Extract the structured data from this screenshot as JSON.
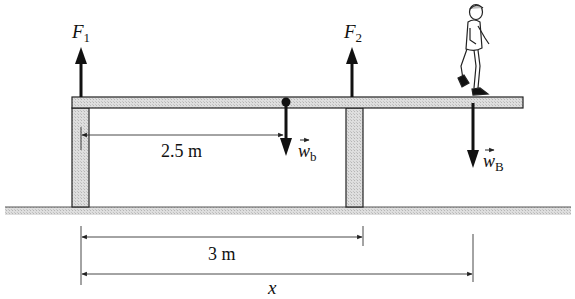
{
  "diagram": {
    "forces": {
      "F1": {
        "symbol": "F",
        "subscript": "1"
      },
      "F2": {
        "symbol": "F",
        "subscript": "2"
      },
      "w_beam": {
        "symbol": "w",
        "subscript": "b"
      },
      "w_boy": {
        "symbol": "w",
        "subscript": "B"
      }
    },
    "dimensions": {
      "beam_cg": "2.5 m",
      "support_spacing": "3 m",
      "boy_position": "x"
    },
    "colors": {
      "beam_fill": "#d9d9d9",
      "ground_fill": "#cfcfcf",
      "ink": "#111111"
    }
  }
}
